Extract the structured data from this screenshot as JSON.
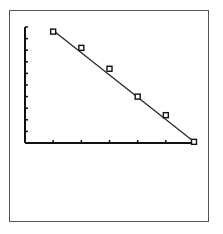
{
  "chart_data": {
    "type": "scatter",
    "title": "",
    "xlabel": "",
    "ylabel": "",
    "x": [
      1,
      2,
      3,
      4,
      5,
      6
    ],
    "series": [
      {
        "name": "data",
        "values": [
          9.6,
          8.2,
          6.4,
          4.0,
          2.4,
          0.1
        ],
        "marker": "square"
      }
    ],
    "fit_line": {
      "from": [
        1,
        9.7
      ],
      "to": [
        6,
        0.1
      ]
    },
    "xlim": [
      0,
      6
    ],
    "ylim": [
      0,
      10
    ],
    "x_ticks": 6,
    "y_ticks": 10,
    "tick_labels_shown": false,
    "grid": false,
    "legend": "none",
    "colors": {
      "axis": "#111111",
      "line": "#222222",
      "marker": "#111111",
      "frame": "#555555"
    }
  },
  "layout": {
    "plot": {
      "x0": 25,
      "y0": 143,
      "x1": 194,
      "y_top": 27
    }
  }
}
